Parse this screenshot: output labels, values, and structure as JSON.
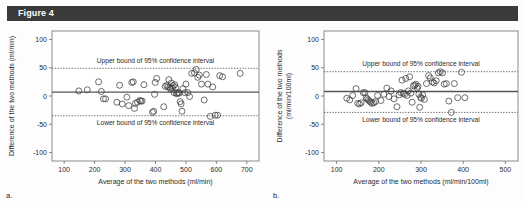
{
  "figure": {
    "label": "Figure 4",
    "bar_color": "#3a3a3a",
    "background": "#fdfdfd"
  },
  "panels": [
    {
      "id": "a",
      "letter": "a."
    },
    {
      "id": "b",
      "letter": "b."
    }
  ],
  "chart_data": [
    {
      "type": "scatter",
      "panel": "a",
      "title": "",
      "xlabel": "Average of the two methods (ml/min)",
      "ylabel": "Difference of the two methods (ml/min)",
      "xlim": [
        60,
        740
      ],
      "ylim": [
        -115,
        115
      ],
      "xticks": [
        100,
        200,
        300,
        400,
        500,
        600,
        700
      ],
      "yticks": [
        -100,
        -50,
        0,
        50,
        100
      ],
      "grid": false,
      "legend": "none",
      "reference_lines": [
        {
          "name": "mean-difference",
          "value": 7,
          "style": "solid",
          "color": "#555555",
          "label": ""
        },
        {
          "name": "upper-limit-of-agreement",
          "value": 49,
          "style": "dotted",
          "color": "#555555",
          "label": "Upper bound of 95% confidence interval"
        },
        {
          "name": "lower-limit-of-agreement",
          "value": -35,
          "style": "dotted",
          "color": "#555555",
          "label": "Lower bound of 95% confidence interval"
        }
      ],
      "annotations": [
        {
          "text": "Upper bound of 95% confidence interval",
          "x": 400,
          "y": 62
        },
        {
          "text": "Lower bound of 95% confidence interval",
          "x": 400,
          "y": -47
        }
      ],
      "marker": {
        "shape": "open-circle",
        "size": 3.0,
        "color": "#3d3d3d"
      },
      "x": [
        148,
        176,
        213,
        222,
        229,
        236,
        273,
        282,
        291,
        306,
        312,
        322,
        327,
        331,
        334,
        341,
        348,
        352,
        356,
        362,
        390,
        394,
        397,
        399,
        404,
        427,
        432,
        437,
        441,
        444,
        447,
        450,
        452,
        455,
        458,
        461,
        463,
        466,
        469,
        472,
        475,
        478,
        481,
        484,
        487,
        490,
        496,
        500,
        506,
        512,
        519,
        528,
        534,
        539,
        544,
        551,
        560,
        567,
        572,
        580,
        588,
        596,
        604,
        611,
        620,
        678
      ],
      "y": [
        9,
        11,
        25,
        8,
        -5,
        -5,
        -11,
        19,
        -14,
        -2,
        -17,
        24,
        25,
        -22,
        -13,
        -11,
        -8,
        -9,
        -9,
        20,
        -29,
        -27,
        3,
        24,
        31,
        -19,
        17,
        19,
        16,
        29,
        15,
        12,
        23,
        14,
        18,
        6,
        20,
        15,
        4,
        5,
        6,
        5,
        -10,
        -14,
        -27,
        13,
        6,
        21,
        6,
        -1,
        40,
        41,
        47,
        33,
        37,
        21,
        -7,
        38,
        21,
        -36,
        16,
        -34,
        -34,
        36,
        34,
        40
      ]
    },
    {
      "type": "scatter",
      "panel": "b",
      "title": "",
      "xlabel": "Average of the two methods (ml/min/100ml)",
      "ylabel": "Difference of the two methods (ml/min/100ml)",
      "ylabel_lines": [
        "Difference of the two methods",
        "(ml/min/100ml)"
      ],
      "xlim": [
        70,
        530
      ],
      "ylim": [
        -115,
        115
      ],
      "xticks": [
        100,
        200,
        300,
        400,
        500
      ],
      "yticks": [
        -100,
        -50,
        0,
        50,
        100
      ],
      "grid": false,
      "legend": "none",
      "reference_lines": [
        {
          "name": "mean-difference",
          "value": 8,
          "style": "solid",
          "color": "#555555",
          "label": ""
        },
        {
          "name": "upper-limit-of-agreement",
          "value": 43,
          "style": "dotted",
          "color": "#555555",
          "label": "Upper bound of 95% confidence interval"
        },
        {
          "name": "lower-limit-of-agreement",
          "value": -29,
          "style": "dotted",
          "color": "#555555",
          "label": "Lower bound of 95% confidence interval"
        }
      ],
      "annotations": [
        {
          "text": "Upper bound of 95% confidence interval",
          "x": 300,
          "y": 58
        },
        {
          "text": "Lower bound of 95% confidence interval",
          "x": 300,
          "y": -42
        }
      ],
      "marker": {
        "shape": "open-circle",
        "size": 3.0,
        "color": "#3d3d3d"
      },
      "x": [
        124,
        131,
        138,
        146,
        150,
        154,
        158,
        163,
        167,
        170,
        172,
        175,
        178,
        181,
        184,
        188,
        192,
        197,
        205,
        212,
        219,
        224,
        229,
        236,
        243,
        248,
        252,
        255,
        258,
        261,
        264,
        267,
        270,
        273,
        276,
        279,
        282,
        285,
        288,
        291,
        293,
        295,
        297,
        299,
        301,
        304,
        308,
        313,
        318,
        322,
        327,
        331,
        336,
        341,
        346,
        351,
        355,
        360,
        366,
        372,
        379,
        387,
        396,
        404
      ],
      "y": [
        -4,
        -7,
        1,
        13,
        -13,
        -14,
        -12,
        6,
        6,
        -3,
        -5,
        -7,
        -9,
        -11,
        -13,
        -12,
        -10,
        1,
        -8,
        3,
        14,
        -1,
        9,
        -5,
        -19,
        2,
        6,
        28,
        5,
        3,
        31,
        1,
        9,
        34,
        5,
        -11,
        18,
        19,
        21,
        14,
        17,
        3,
        -20,
        -2,
        -4,
        2,
        -6,
        22,
        36,
        32,
        25,
        23,
        27,
        41,
        43,
        41,
        21,
        22,
        -9,
        -29,
        22,
        -3,
        42,
        -3
      ]
    }
  ]
}
